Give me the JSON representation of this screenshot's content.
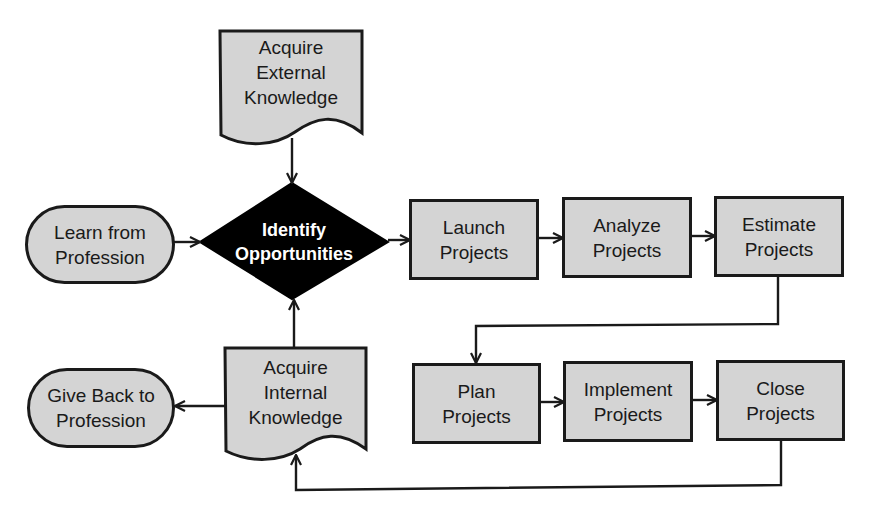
{
  "diagram": {
    "type": "flowchart",
    "colors": {
      "box_fill": "#d4d4d4",
      "stroke": "#1a1a1a",
      "decision_fill": "#000000",
      "decision_text": "#ffffff"
    },
    "nodes": {
      "acquire_external": {
        "label": "Acquire\nExternal\nKnowledge",
        "shape": "document"
      },
      "learn_from_profession": {
        "label": "Learn from\nProfession",
        "shape": "terminator"
      },
      "identify_opportunities": {
        "label": "Identify\nOpportunities",
        "shape": "decision"
      },
      "launch_projects": {
        "label": "Launch\nProjects",
        "shape": "process"
      },
      "analyze_projects": {
        "label": "Analyze\nProjects",
        "shape": "process"
      },
      "estimate_projects": {
        "label": "Estimate\nProjects",
        "shape": "process"
      },
      "plan_projects": {
        "label": "Plan\nProjects",
        "shape": "process"
      },
      "implement_projects": {
        "label": "Implement\nProjects",
        "shape": "process"
      },
      "close_projects": {
        "label": "Close\nProjects",
        "shape": "process"
      },
      "acquire_internal": {
        "label": "Acquire\nInternal\nKnowledge",
        "shape": "document"
      },
      "give_back_to_profession": {
        "label": "Give Back to\nProfession",
        "shape": "terminator"
      }
    },
    "edges": [
      {
        "from": "acquire_external",
        "to": "identify_opportunities"
      },
      {
        "from": "learn_from_profession",
        "to": "identify_opportunities"
      },
      {
        "from": "acquire_internal",
        "to": "identify_opportunities"
      },
      {
        "from": "identify_opportunities",
        "to": "launch_projects"
      },
      {
        "from": "launch_projects",
        "to": "analyze_projects"
      },
      {
        "from": "analyze_projects",
        "to": "estimate_projects"
      },
      {
        "from": "estimate_projects",
        "to": "plan_projects"
      },
      {
        "from": "plan_projects",
        "to": "implement_projects"
      },
      {
        "from": "implement_projects",
        "to": "close_projects"
      },
      {
        "from": "close_projects",
        "to": "acquire_internal"
      },
      {
        "from": "acquire_internal",
        "to": "give_back_to_profession"
      }
    ]
  }
}
